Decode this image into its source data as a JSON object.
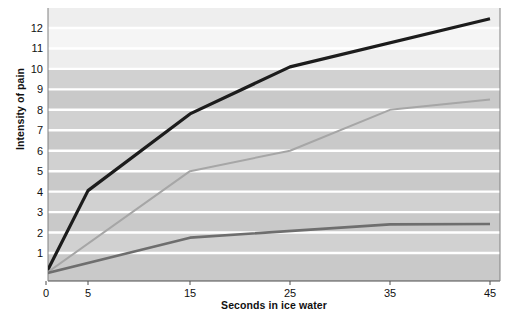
{
  "chart_data": {
    "type": "line",
    "title": "",
    "xlabel": "Seconds in ice water",
    "ylabel": "Intensity of pain",
    "xticks": [
      0,
      5,
      15,
      25,
      35,
      45
    ],
    "xtick_labels": [
      "0",
      "5",
      "15",
      "25",
      "35",
      "45"
    ],
    "yticks": [
      1,
      2,
      3,
      4,
      5,
      6,
      7,
      8,
      9,
      10,
      11,
      12
    ],
    "ytick_labels": [
      "1",
      "2",
      "3",
      "4",
      "5",
      "6",
      "7",
      "8",
      "9",
      "10",
      "11",
      "12"
    ],
    "xlim": [
      0,
      45
    ],
    "ylim": [
      0,
      12.6
    ],
    "grid": "horizontal white gridlines at each integer",
    "legend_position": "inline annotations at right of each curve",
    "series": [
      {
        "name": "Normal waking pain",
        "color": "#1c1c1c",
        "x": [
          0,
          5,
          15,
          25,
          45
        ],
        "y": [
          0,
          4.05,
          7.8,
          10.1,
          12.45
        ]
      },
      {
        "name": "Pain indicated by automatic key pressing (hidden observer)",
        "color": "#a6a6a6",
        "x": [
          0,
          15,
          25,
          35,
          45
        ],
        "y": [
          0,
          5.0,
          6.0,
          8.0,
          8.5
        ]
      },
      {
        "name": "Pain indicated by verbal report",
        "color": "#6e6e6e",
        "x": [
          0,
          15,
          35,
          45
        ],
        "y": [
          0,
          1.75,
          2.4,
          2.42
        ]
      }
    ],
    "annotations": [
      {
        "id": "normal-waking-pain",
        "lines": "Normal\nwaking pain",
        "x": 35.2,
        "y": 11.1
      },
      {
        "id": "automatic-key-pressing",
        "lines": "Pain indicated by\nautomatic\nkey pressing\n(hidden observer)",
        "x": 35.2,
        "y": 8.2
      },
      {
        "id": "verbal-report",
        "lines": "Pain indicated by\nverbal report",
        "x": 35.2,
        "y": 2.3
      }
    ],
    "background": {
      "upper_band_color": "#eeeeee",
      "lower_band_color": "#c9c9c9",
      "band_split_value": 10,
      "gridline_color": "#ffffff"
    }
  },
  "axis": {
    "y_title": "Intensity of pain",
    "x_title": "Seconds in ice water"
  }
}
